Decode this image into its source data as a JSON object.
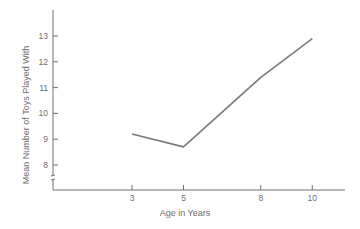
{
  "chart_data": {
    "type": "line",
    "title": "",
    "xlabel": "Age in Years",
    "ylabel": "Mean Number of Toys Played With",
    "x": [
      3,
      5,
      8,
      10
    ],
    "series": [
      {
        "name": "Mean toys played with",
        "values": [
          9.2,
          8.7,
          11.4,
          12.9
        ]
      }
    ],
    "x_ticks": [
      3,
      5,
      8,
      10
    ],
    "y_ticks": [
      8,
      9,
      10,
      11,
      12,
      13
    ],
    "ylim": [
      7,
      14
    ],
    "y_axis_break": true,
    "grid": false,
    "legend": "none"
  },
  "colors": {
    "line": "#7a7a7a",
    "axis": "#707070",
    "text": "#6e6e6e"
  }
}
